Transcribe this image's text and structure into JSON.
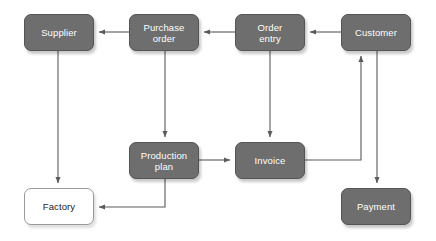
{
  "diagram": {
    "canvas": {
      "width": 436,
      "height": 241,
      "background": "#ffffff"
    },
    "style": {
      "node_fill": "#6e6e6e",
      "node_text": "#ffffff",
      "node_border": "#555555",
      "outline_fill": "#ffffff",
      "outline_text": "#222222",
      "outline_border": "#9a9a9a",
      "edge_color": "#5a5a5a"
    },
    "nodes": [
      {
        "id": "supplier",
        "label": "Supplier",
        "x": 24,
        "y": 14,
        "w": 70,
        "h": 37,
        "variant": "filled"
      },
      {
        "id": "purchase-order",
        "label": "Purchase\norder",
        "x": 129,
        "y": 14,
        "w": 70,
        "h": 37,
        "variant": "filled"
      },
      {
        "id": "order-entry",
        "label": "Order\nentry",
        "x": 235,
        "y": 14,
        "w": 70,
        "h": 37,
        "variant": "filled"
      },
      {
        "id": "customer",
        "label": "Customer",
        "x": 341,
        "y": 14,
        "w": 70,
        "h": 37,
        "variant": "filled"
      },
      {
        "id": "production-plan",
        "label": "Production\nplan",
        "x": 129,
        "y": 142,
        "w": 70,
        "h": 37,
        "variant": "filled"
      },
      {
        "id": "invoice",
        "label": "Invoice",
        "x": 235,
        "y": 142,
        "w": 70,
        "h": 37,
        "variant": "filled"
      },
      {
        "id": "factory",
        "label": "Factory",
        "x": 24,
        "y": 188,
        "w": 70,
        "h": 37,
        "variant": "outline"
      },
      {
        "id": "payment",
        "label": "Payment",
        "x": 341,
        "y": 188,
        "w": 70,
        "h": 37,
        "variant": "filled"
      }
    ],
    "edges": [
      {
        "id": "customer-to-order-entry",
        "from": "customer",
        "to": "order-entry",
        "points": "341,32 310,32"
      },
      {
        "id": "order-entry-to-purchase-order",
        "from": "order-entry",
        "to": "purchase-order",
        "points": "235,32 204,32"
      },
      {
        "id": "purchase-order-to-supplier",
        "from": "purchase-order",
        "to": "supplier",
        "points": "129,32 99,32"
      },
      {
        "id": "supplier-to-factory",
        "from": "supplier",
        "to": "factory",
        "points": "58,51 58,183"
      },
      {
        "id": "purchase-order-to-production",
        "from": "purchase-order",
        "to": "production-plan",
        "points": "165,51 165,137"
      },
      {
        "id": "order-entry-to-invoice",
        "from": "order-entry",
        "to": "invoice",
        "points": "270,51 270,137"
      },
      {
        "id": "production-to-invoice",
        "from": "production-plan",
        "to": "invoice",
        "points": "199,160 230,160"
      },
      {
        "id": "production-to-factory",
        "from": "production-plan",
        "to": "factory",
        "points": "165,179 165,207 99,207"
      },
      {
        "id": "invoice-to-customer",
        "from": "invoice",
        "to": "customer",
        "points": "305,160 361,160 361,56"
      },
      {
        "id": "customer-to-payment",
        "from": "customer",
        "to": "payment",
        "points": "377,51 377,183"
      }
    ]
  }
}
